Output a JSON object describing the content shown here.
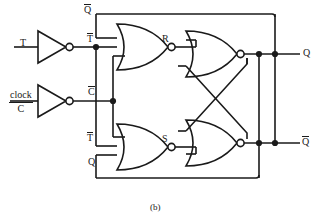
{
  "figure": {
    "caption": "(b)",
    "width": 319,
    "height": 224,
    "line_color": "#1a1a1a",
    "background_color": "#ffffff"
  },
  "inputs": [
    {
      "id": "t-input",
      "label": "T",
      "x": 22,
      "y": 44
    },
    {
      "id": "clock-input",
      "label_top": "clock",
      "label_bottom": "C",
      "x": 10,
      "y": 98
    }
  ],
  "outputs": [
    {
      "id": "q-output",
      "label": "Q",
      "overbar": false,
      "x": 300,
      "y": 54
    },
    {
      "id": "qbar-output",
      "label": "Q",
      "overbar": true,
      "x": 300,
      "y": 143
    }
  ],
  "wire_labels": [
    {
      "id": "qbar-feedback-label",
      "label": "Q",
      "overbar": true,
      "x": 84,
      "y": 8
    },
    {
      "id": "tbar-top-label",
      "label": "T",
      "overbar": true,
      "x": 87,
      "y": 40
    },
    {
      "id": "cbar-label",
      "label": "C",
      "overbar": true,
      "x": 87,
      "y": 92
    },
    {
      "id": "tbar-bottom-label",
      "label": "T",
      "overbar": true,
      "x": 87,
      "y": 143
    },
    {
      "id": "q-feedback-label",
      "label": "Q",
      "overbar": false,
      "x": 87,
      "y": 162
    },
    {
      "id": "r-label",
      "label": "R",
      "overbar": false,
      "x": 163,
      "y": 39
    },
    {
      "id": "s-label",
      "label": "S",
      "overbar": false,
      "x": 163,
      "y": 149
    }
  ],
  "gates": [
    {
      "id": "inverter-t",
      "type": "inverter",
      "name": "t-inverter"
    },
    {
      "id": "inverter-clock",
      "type": "inverter",
      "name": "clock-inverter"
    },
    {
      "id": "nor-r",
      "type": "nor",
      "name": "nor-gate-r",
      "output_label": "R"
    },
    {
      "id": "nor-s",
      "type": "nor",
      "name": "nor-gate-s",
      "output_label": "S"
    },
    {
      "id": "nor-q",
      "type": "nor",
      "name": "nor-gate-q",
      "output_label": "Q"
    },
    {
      "id": "nor-qbar",
      "type": "nor",
      "name": "nor-gate-qbar",
      "output_label": "Qbar"
    }
  ],
  "junctions": [
    {
      "id": "junction-tbar-bus",
      "x": 96,
      "y": 47
    },
    {
      "id": "junction-cbar-bus",
      "x": 113,
      "y": 101
    },
    {
      "id": "junction-q-node-a",
      "x": 259,
      "y": 54
    },
    {
      "id": "junction-q-node-b",
      "x": 275,
      "y": 54
    },
    {
      "id": "junction-qbar-node-a",
      "x": 259,
      "y": 143
    },
    {
      "id": "junction-qbar-node-b",
      "x": 275,
      "y": 143
    }
  ]
}
